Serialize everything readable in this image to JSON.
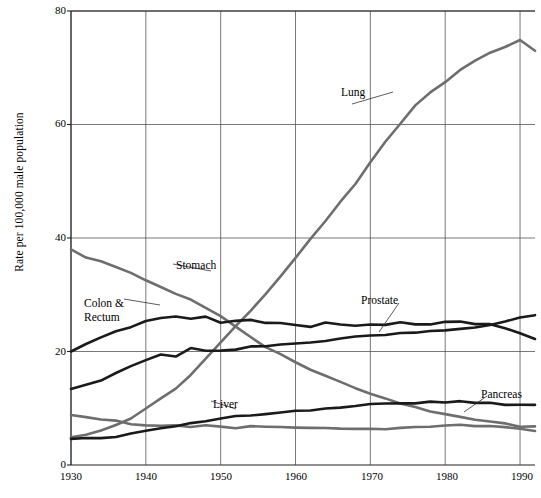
{
  "chart_data": {
    "type": "line",
    "title": "",
    "xlabel": "",
    "ylabel": "Rate per 100,000 male population",
    "xlim": [
      1930,
      1992
    ],
    "ylim": [
      0,
      80
    ],
    "xticks": [
      1930,
      1940,
      1950,
      1960,
      1970,
      1980,
      1990
    ],
    "yticks": [
      0,
      20,
      40,
      60,
      80
    ],
    "grid": true,
    "legend_position": "inline-annotations",
    "x": [
      1930,
      1932,
      1934,
      1936,
      1938,
      1940,
      1942,
      1944,
      1946,
      1948,
      1950,
      1952,
      1954,
      1956,
      1958,
      1960,
      1962,
      1964,
      1966,
      1968,
      1970,
      1972,
      1974,
      1976,
      1978,
      1980,
      1982,
      1984,
      1986,
      1988,
      1990,
      1992
    ],
    "series": [
      {
        "name": "Lung",
        "color": "#6e6e6e",
        "label_x": 1972,
        "label_y": 62,
        "values": [
          4.9,
          5.4,
          6.2,
          7.2,
          8.4,
          10.0,
          11.8,
          13.6,
          16.0,
          18.6,
          21.6,
          24.3,
          27.0,
          30.0,
          33.0,
          36.4,
          40.0,
          43.2,
          46.4,
          49.6,
          53.4,
          57.0,
          60.4,
          63.2,
          65.4,
          67.4,
          69.4,
          71.2,
          72.4,
          73.6,
          74.8,
          73.0
        ]
      },
      {
        "name": "Stomach",
        "color": "#6e6e6e",
        "label_x": 1944,
        "label_y": 30.5,
        "values": [
          38.0,
          36.8,
          35.8,
          34.8,
          33.6,
          32.4,
          31.2,
          30.0,
          29.0,
          27.8,
          26.4,
          24.4,
          22.6,
          21.0,
          19.6,
          18.2,
          16.8,
          15.6,
          14.4,
          13.4,
          12.4,
          11.6,
          10.8,
          10.2,
          9.6,
          9.0,
          8.6,
          8.2,
          7.8,
          7.4,
          7.0,
          6.8
        ]
      },
      {
        "name": "Colon & Rectum",
        "color": "#1a1a1a",
        "label_x": 1936,
        "label_y": 28.5,
        "values": [
          20.0,
          21.2,
          22.4,
          23.6,
          24.4,
          25.4,
          26.0,
          26.4,
          25.8,
          26.4,
          25.0,
          25.2,
          25.4,
          25.0,
          25.0,
          24.6,
          24.2,
          25.0,
          25.0,
          24.8,
          25.0,
          24.8,
          25.2,
          25.0,
          25.0,
          25.2,
          25.0,
          24.8,
          24.6,
          24.0,
          23.0,
          22.2
        ]
      },
      {
        "name": "Prostate",
        "color": "#1a1a1a",
        "label_x": 1968,
        "label_y": 27.5,
        "values": [
          13.4,
          14.2,
          15.0,
          16.2,
          17.4,
          18.4,
          19.2,
          19.0,
          20.6,
          20.0,
          20.0,
          20.4,
          21.0,
          21.2,
          21.4,
          21.6,
          21.8,
          22.0,
          22.2,
          22.4,
          22.6,
          22.8,
          23.0,
          23.2,
          23.4,
          23.6,
          24.0,
          24.4,
          24.8,
          25.4,
          26.2,
          26.4
        ]
      },
      {
        "name": "Liver",
        "color": "#6e6e6e",
        "label_x": 1952,
        "label_y": 11.5,
        "values": [
          8.8,
          8.4,
          8.0,
          7.6,
          7.4,
          7.2,
          7.0,
          7.0,
          6.8,
          7.0,
          6.8,
          6.6,
          6.6,
          6.6,
          6.6,
          6.4,
          6.4,
          6.4,
          6.4,
          6.4,
          6.4,
          6.4,
          6.6,
          6.8,
          6.8,
          7.0,
          7.0,
          6.8,
          6.6,
          6.4,
          6.2,
          6.0
        ]
      },
      {
        "name": "Pancreas",
        "color": "#1a1a1a",
        "label_x": 1982,
        "label_y": 13.5,
        "values": [
          4.6,
          4.8,
          5.0,
          5.2,
          5.6,
          6.0,
          6.4,
          6.8,
          7.2,
          7.6,
          8.0,
          8.4,
          8.8,
          9.0,
          9.4,
          9.6,
          9.8,
          10.0,
          10.2,
          10.4,
          10.6,
          10.6,
          10.8,
          10.8,
          11.0,
          11.0,
          11.0,
          11.0,
          11.0,
          10.8,
          10.8,
          10.6
        ]
      }
    ]
  },
  "axis": {
    "ylabel": "Rate per 100,000 male population",
    "ytick_labels": [
      "0",
      "20",
      "40",
      "60",
      "80"
    ],
    "xtick_labels": [
      "1930",
      "1940",
      "1950",
      "1960",
      "1970",
      "1980",
      "1990"
    ]
  },
  "labels": {
    "lung": "Lung",
    "stomach": "Stomach",
    "colon_rectum_line1": "Colon &",
    "colon_rectum_line2": "Rectum",
    "prostate": "Prostate",
    "liver": "Liver",
    "pancreas": "Pancreas"
  }
}
